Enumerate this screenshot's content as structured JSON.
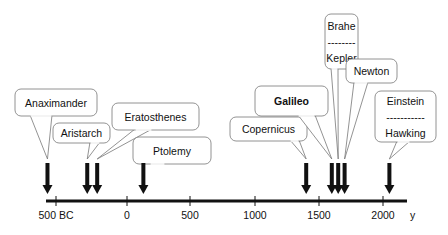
{
  "chart_data": {
    "type": "timeline",
    "title": "",
    "axis": {
      "unit_label": "y",
      "range": [
        -600,
        2100
      ],
      "ticks": [
        {
          "value": -500,
          "label": "500 BC"
        },
        {
          "value": 0,
          "label": "0"
        },
        {
          "value": 500,
          "label": "500"
        },
        {
          "value": 1000,
          "label": "1000"
        },
        {
          "value": 1500,
          "label": "1500"
        },
        {
          "value": 2000,
          "label": "2000"
        }
      ]
    },
    "events": [
      {
        "id": "anaximander",
        "lines": [
          "Anaximander"
        ],
        "year": -560,
        "bold": false
      },
      {
        "id": "aristarch",
        "lines": [
          "Aristarch"
        ],
        "year": -280,
        "bold": false
      },
      {
        "id": "eratosthenes",
        "lines": [
          "Eratosthenes"
        ],
        "year": -210,
        "bold": false
      },
      {
        "id": "ptolemy",
        "lines": [
          "Ptolemy"
        ],
        "year": 130,
        "bold": false
      },
      {
        "id": "copernicus",
        "lines": [
          "Copernicus"
        ],
        "year": 1400,
        "bold": false
      },
      {
        "id": "galileo",
        "lines": [
          "Galileo"
        ],
        "year": 1600,
        "bold": true
      },
      {
        "id": "brahe-kepler",
        "lines": [
          "Brahe",
          "--------",
          "Kepler"
        ],
        "year": 1650,
        "bold": false
      },
      {
        "id": "newton",
        "lines": [
          "Newton"
        ],
        "year": 1700,
        "bold": false
      },
      {
        "id": "einstein-hawking",
        "lines": [
          "Einstein",
          "-----------",
          "Hawking"
        ],
        "year": 2050,
        "bold": false
      }
    ]
  },
  "colors": {
    "line": "#111111",
    "callout_border": "#777777",
    "callout_fill": "#ffffff"
  }
}
